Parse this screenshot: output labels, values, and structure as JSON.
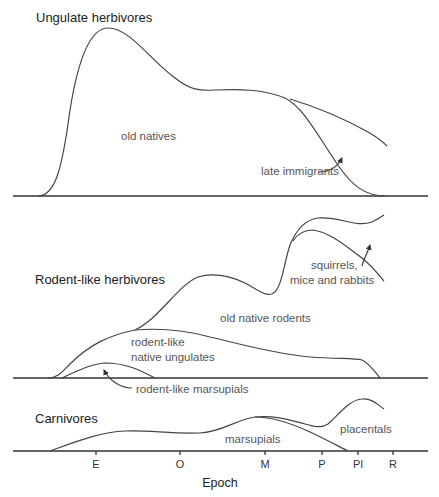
{
  "panels": [
    {
      "title": "Ungulate herbivores",
      "labels": {
        "old_natives": "old natives",
        "late_immigrants": "late immigrants"
      }
    },
    {
      "title": "Rodent-like herbivores",
      "labels": {
        "squirrels_line1": "squirrels,",
        "squirrels_line2": "mice and rabbits",
        "old_native_rodents": "old native rodents",
        "rodent_like_line1": "rodent-like",
        "rodent_like_line2": "native ungulates",
        "rodent_like_marsupials": "rodent-like marsupials"
      }
    },
    {
      "title": "Carnivores",
      "labels": {
        "placentals": "placentals",
        "marsupials": "marsupials"
      }
    }
  ],
  "x_axis": {
    "label": "Epoch",
    "ticks": [
      "E",
      "O",
      "M",
      "P",
      "Pl",
      "R"
    ]
  }
}
